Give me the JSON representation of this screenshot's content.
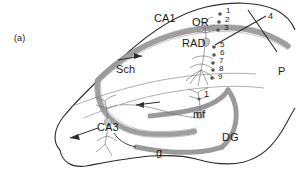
{
  "figure": {
    "panel_label": "(a)",
    "colors": {
      "outline": "#2b2b2b",
      "fiber": "#8c8c8c",
      "cell_layer": "#9a9a9a",
      "site_dot": "#555555",
      "text": "#1a1a1a",
      "background": "#ffffff"
    }
  },
  "region_labels": {
    "ca1": "CA1",
    "ca3": "CA3",
    "dg": "DG",
    "or": "OR",
    "rad": "RAD",
    "sch": "Sch",
    "mf": "mf",
    "g": "g",
    "p": "P"
  },
  "site_labels": {
    "electrode_column": [
      "1",
      "2",
      "3",
      "5",
      "6",
      "7",
      "8",
      "9"
    ],
    "stimulus_lead": "4",
    "mossy_fiber_site": "1"
  }
}
